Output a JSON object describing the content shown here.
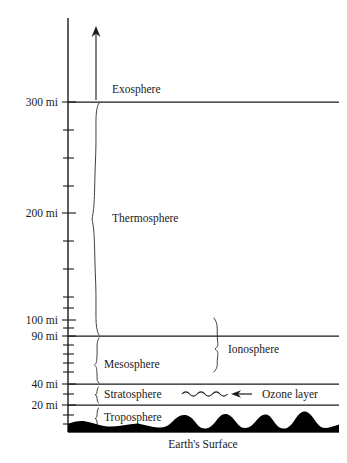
{
  "diagram": {
    "title_visible": false,
    "ground_label": "Earth's Surface",
    "axis": {
      "unit": "mi",
      "name": "altitude-axis",
      "ticks": [
        {
          "label": "300 mi",
          "value": 300,
          "major": true,
          "y": 102
        },
        {
          "label": "200 mi",
          "value": 200,
          "major": true,
          "y": 213
        },
        {
          "label": "100 mi",
          "value": 100,
          "major": true,
          "y": 320
        },
        {
          "label": "90 mi",
          "value": 90,
          "major": true,
          "y": 336
        },
        {
          "label": "40 mi",
          "value": 40,
          "major": true,
          "y": 384
        },
        {
          "label": "20 mi",
          "value": 20,
          "major": true,
          "y": 405
        }
      ],
      "minor_tick_y": [
        130,
        158,
        186,
        241,
        269,
        297,
        308,
        328,
        345,
        354,
        363,
        372,
        394,
        415,
        424
      ]
    },
    "boundary_lines": [
      {
        "name": "line-300mi",
        "y": 102
      },
      {
        "name": "line-90mi",
        "y": 336
      },
      {
        "name": "line-40mi",
        "y": 384
      },
      {
        "name": "line-20mi",
        "y": 405
      }
    ],
    "layers": [
      {
        "name": "exosphere",
        "label": "Exosphere",
        "label_x": 112,
        "label_y": 93,
        "brace": false
      },
      {
        "name": "thermosphere",
        "label": "Thermosphere",
        "label_x": 112,
        "label_y": 222,
        "brace": true,
        "brace_x": 97,
        "brace_top": 103,
        "brace_bottom": 336
      },
      {
        "name": "mesosphere",
        "label": "Mesosphere",
        "label_x": 104,
        "label_y": 368,
        "brace": true,
        "brace_x": 97,
        "brace_top": 338,
        "brace_bottom": 383
      },
      {
        "name": "stratosphere",
        "label": "Stratosphere",
        "label_x": 104,
        "label_y": 398,
        "brace": true,
        "brace_x": 97,
        "brace_top": 386,
        "brace_bottom": 403
      },
      {
        "name": "troposphere",
        "label": "Troposphere",
        "label_x": 104,
        "label_y": 420,
        "brace": true,
        "brace_x": 97,
        "brace_top": 407,
        "brace_bottom": 428
      }
    ],
    "ionosphere": {
      "name": "ionosphere",
      "label": "Ionosphere",
      "label_x": 228,
      "label_y": 352,
      "brace_x": 218,
      "brace_top": 318,
      "brace_bottom": 372
    },
    "ozone": {
      "name": "ozone-layer",
      "label": "Ozone layer",
      "label_x": 262,
      "label_y": 398,
      "wave_start_x": 182,
      "wave_end_x": 228,
      "wave_y": 394,
      "arrow_from_x": 252,
      "arrow_to_x": 232,
      "arrow_y": 394
    },
    "up_arrow": {
      "name": "upward-arrow",
      "x": 96,
      "y_bottom": 100,
      "y_top": 28
    },
    "colors": {
      "ink": "#1a1a1a",
      "terrain": "#000000",
      "background": "#ffffff"
    }
  }
}
